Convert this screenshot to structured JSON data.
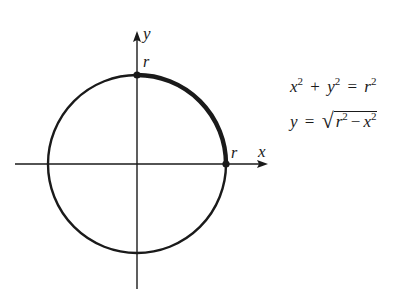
{
  "diagram": {
    "type": "circle-on-axes",
    "colors": {
      "ink": "#1a1a1a",
      "background": "#ffffff"
    },
    "axes": {
      "x_label": "x",
      "y_label": "y"
    },
    "circle": {
      "center_px": [
        137,
        164
      ],
      "radius_px": 89,
      "highlighted_arc": "first quadrant, from (0, r) to (r, 0)"
    },
    "points": [
      {
        "label": "r",
        "position": "top intercept (0, r)"
      },
      {
        "label": "r",
        "position": "right intercept (r, 0)"
      }
    ]
  },
  "equations": {
    "line1": {
      "x": "x",
      "x_exp": "2",
      "plus": "+",
      "y": "y",
      "y_exp": "2",
      "eq": "=",
      "r": "r",
      "r_exp": "2"
    },
    "line2": {
      "y": "y",
      "eq": "=",
      "sqrt_sign": "√",
      "r": "r",
      "r_exp": "2",
      "minus": "−",
      "x": "x",
      "x_exp": "2"
    }
  }
}
